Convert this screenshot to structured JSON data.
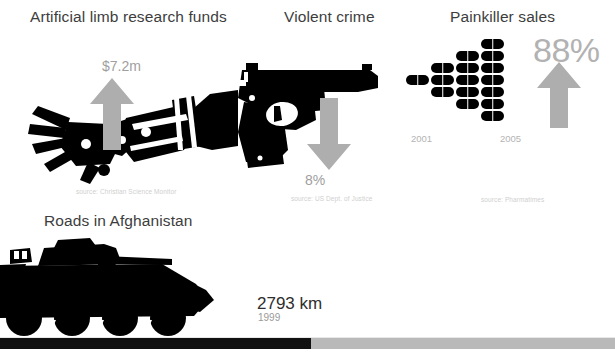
{
  "canvas": {
    "width": 615,
    "height": 358,
    "background": "#ffffff"
  },
  "palette": {
    "ink": "#000000",
    "title_text": "#3d3d3d",
    "value_gray": "#a0a0a0",
    "arrow_gray": "#aeaeae",
    "source_gray": "#cfcfcf",
    "bar_black": "#111111",
    "bar_gray": "#b9b9b9"
  },
  "panels": [
    {
      "id": "artificial-limb",
      "title": "Artificial limb research funds",
      "value": "$7.2m",
      "direction": "up",
      "icon": "prosthetic-arm-icon",
      "source": "source: Christian Science Monitor"
    },
    {
      "id": "violent-crime",
      "title": "Violent crime",
      "value": "8%",
      "direction": "down",
      "icon": "handgun-icon",
      "source": "source: US Dept. of Justice"
    },
    {
      "id": "painkiller-sales",
      "title": "Painkiller sales",
      "value": "88%",
      "direction": "up",
      "icon": "pill-icon",
      "source": "source: Pharmatimes",
      "year_start": "2001",
      "year_end": "2005"
    }
  ],
  "roads_panel": {
    "id": "roads-afghanistan",
    "title": "Roads in Afghanistan",
    "value": "2793 km",
    "year": "1999",
    "icon": "armored-vehicle-icon"
  },
  "chart_data": {
    "type": "bar",
    "title": "Painkiller sales",
    "categories": [
      "2001",
      "",
      "",
      "2005"
    ],
    "values": [
      1,
      3,
      5,
      7
    ],
    "unit": "pill pictogram (each icon = 1 unit)",
    "annotation": "88%",
    "xlabel": "",
    "ylabel": "",
    "legend": "none",
    "grid": false
  },
  "bottom_bar": {
    "filled_width_px": 311,
    "total_width_px": 615
  }
}
